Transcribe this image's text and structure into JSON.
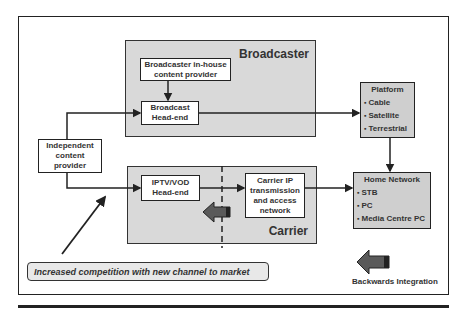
{
  "diagram": {
    "regions": {
      "broadcaster": {
        "label": "Broadcaster"
      },
      "carrier": {
        "label": "Carrier"
      }
    },
    "nodes": {
      "broadcaster_inhouse": {
        "line1": "Broadcaster in-house",
        "line2": "content provider"
      },
      "broadcast_headend": {
        "line1": "Broadcast",
        "line2": "Head-end"
      },
      "independent": {
        "line1": "Independent",
        "line2": "content",
        "line3": "provider"
      },
      "iptv_headend": {
        "line1": "IPTV/VOD",
        "line2": "Head-end"
      },
      "carrier_ip": {
        "line1": "Carrier IP",
        "line2": "transmission",
        "line3": "and access",
        "line4": "network"
      },
      "platform": {
        "title": "Platform",
        "items": [
          "Cable",
          "Satellite",
          "Terrestrial"
        ]
      },
      "home_network": {
        "title": "Home Network",
        "items": [
          "STB",
          "PC",
          "Media Centre PC"
        ]
      }
    },
    "banner": "Increased competition with new channel to market",
    "legend": {
      "backwards_integration": "Backwards Integration"
    },
    "colors": {
      "region_fill": "#d9d9d9",
      "node_grey": "#cfcfcf",
      "arrow_fill": "#5a5a5a",
      "line": "#222222"
    }
  }
}
